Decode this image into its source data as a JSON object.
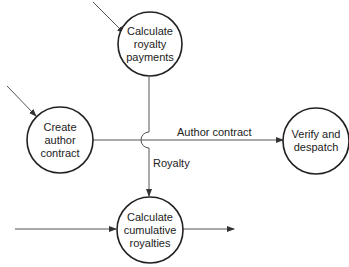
{
  "nodes": [
    {
      "id": "calc-royalty",
      "lines": [
        "Calculate",
        "royalty",
        "payments"
      ],
      "cx": 150,
      "cy": 44,
      "r": 32
    },
    {
      "id": "create-contract",
      "lines": [
        "Create",
        "author",
        "contract"
      ],
      "cx": 60,
      "cy": 140,
      "r": 33
    },
    {
      "id": "verify-despatch",
      "lines": [
        "Verify and",
        "despatch"
      ],
      "cx": 316,
      "cy": 141,
      "r": 33
    },
    {
      "id": "calc-cumulative",
      "lines": [
        "Calculate",
        "cumulative",
        "royalties"
      ],
      "cx": 150,
      "cy": 230,
      "r": 33
    }
  ],
  "flows": {
    "author_contract": "Author contract",
    "royalty": "Royalty"
  },
  "colors": {
    "stroke": "#333333",
    "text": "#222222"
  }
}
